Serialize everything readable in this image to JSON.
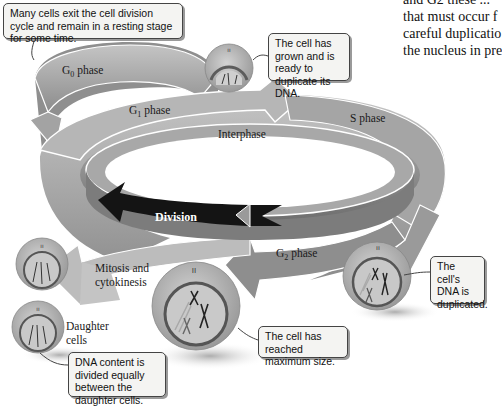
{
  "body_text": {
    "lines": [
      "and G2 these ...",
      "that must occur f",
      "careful duplicatio",
      "the nucleus in pre"
    ]
  },
  "phases": {
    "g0": {
      "main": "G",
      "sub": "0",
      "suffix": " phase"
    },
    "g1": {
      "main": "G",
      "sub": "1",
      "suffix": " phase"
    },
    "s": {
      "label": "S phase"
    },
    "g2": {
      "main": "G",
      "sub": "2",
      "suffix": " phase"
    },
    "interphase": {
      "label": "Interphase"
    },
    "division": {
      "label": "Division"
    },
    "mitosis": {
      "line1": "Mitosis and",
      "line2": "cytokinesis"
    },
    "daughter": {
      "line1": "Daughter",
      "line2": "cells"
    }
  },
  "callouts": {
    "g0_note": "Many cells exit the cell division cycle and remain in a resting stage for some time.",
    "g1_note": "The cell has grown and is ready to duplicate its DNA.",
    "s_note": "The cell's DNA is duplicated.",
    "g2_note": "The cell has reached maximum size.",
    "daughter_note": "DNA content is divided equally between the daughter cells."
  },
  "colors": {
    "outer_ring": "#a8a8a8",
    "outer_ring_dark": "#8a8a8a",
    "inner_ring": "#9a9a9a",
    "inner_ring_dark": "#6e6e6e",
    "division_arrow": "#111111",
    "g0_band": "#8e8e8e",
    "cell_fill": "#b5b5b5",
    "nucleus": "#c9c9c9",
    "callout_bg": "#f4f4f2"
  }
}
